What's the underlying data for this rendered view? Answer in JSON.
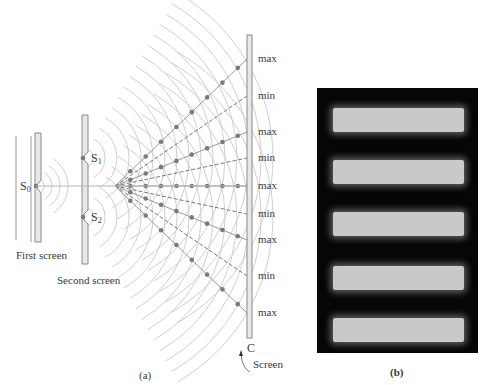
{
  "figure": {
    "part_a_label": "(a)",
    "part_b_label": "(b)",
    "first_screen_label": "First screen",
    "second_screen_label": "Second screen",
    "screen_label": "Screen",
    "screen_point_label": "C",
    "source_label": "S",
    "source_sub": "0",
    "slit1_label": "S",
    "slit1_sub": "1",
    "slit2_label": "S",
    "slit2_sub": "2",
    "screen_marks": [
      {
        "text": "max",
        "y": 59
      },
      {
        "text": "min",
        "y": 96
      },
      {
        "text": "max",
        "y": 132
      },
      {
        "text": "min",
        "y": 158
      },
      {
        "text": "max",
        "y": 186
      },
      {
        "text": "min",
        "y": 214
      },
      {
        "text": "max",
        "y": 240
      },
      {
        "text": "min",
        "y": 276
      },
      {
        "text": "max",
        "y": 313
      }
    ]
  },
  "colors": {
    "line": "#8a8a8a",
    "wave": "#cfcfcf",
    "dot": "#7a7a7a",
    "bar_fill": "#e8e8e8",
    "panel_bg": "#060606",
    "fringe": "#c9c9c9"
  },
  "fringes": [
    {
      "top": 20
    },
    {
      "top": 72
    },
    {
      "top": 124
    },
    {
      "top": 178
    },
    {
      "top": 230
    }
  ]
}
